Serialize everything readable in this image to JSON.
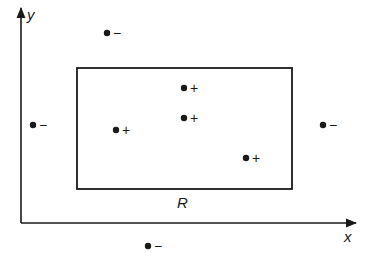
{
  "diagram": {
    "axes": {
      "x_label": "x",
      "y_label": "y",
      "origin": [
        21,
        223
      ],
      "x_end": [
        358,
        223
      ],
      "y_end": [
        21,
        5
      ]
    },
    "region": {
      "label": "R",
      "rect": {
        "left": 77,
        "top": 68,
        "right": 292,
        "bottom": 189
      },
      "label_pos": [
        183,
        207
      ]
    },
    "points": [
      {
        "x": 107,
        "y": 33,
        "sign": "−",
        "class": "negative",
        "inside": false
      },
      {
        "x": 33,
        "y": 125,
        "sign": "−",
        "class": "negative",
        "inside": false
      },
      {
        "x": 323,
        "y": 125,
        "sign": "−",
        "class": "negative",
        "inside": false
      },
      {
        "x": 148,
        "y": 246,
        "sign": "−",
        "class": "negative",
        "inside": false
      },
      {
        "x": 116,
        "y": 130,
        "sign": "+",
        "class": "positive",
        "inside": true
      },
      {
        "x": 184,
        "y": 88,
        "sign": "+",
        "class": "positive",
        "inside": true
      },
      {
        "x": 184,
        "y": 118,
        "sign": "+",
        "class": "positive",
        "inside": true
      },
      {
        "x": 246,
        "y": 158,
        "sign": "+",
        "class": "positive",
        "inside": true
      }
    ],
    "colors": {
      "ink": "#1a1a1a",
      "background": "#ffffff"
    }
  }
}
